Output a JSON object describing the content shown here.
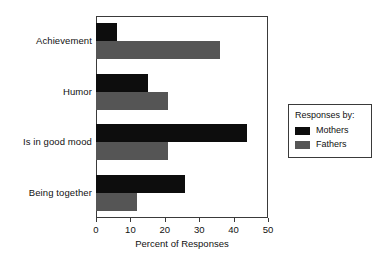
{
  "chart_data": {
    "type": "bar",
    "orientation": "horizontal",
    "title": "",
    "xlabel": "Percent of Responses",
    "ylabel": "",
    "xlim": [
      0,
      50
    ],
    "xticks": [
      0,
      10,
      20,
      30,
      40,
      50
    ],
    "xtick_labels": [
      "0",
      "10",
      "20",
      "30",
      "40",
      "50"
    ],
    "grid": false,
    "categories": [
      "Achievement",
      "Humor",
      "Is in good mood",
      "Being together"
    ],
    "series": [
      {
        "name": "Mothers",
        "color": "#0d0d0d",
        "values": [
          6,
          15,
          44,
          26
        ]
      },
      {
        "name": "Fathers",
        "color": "#555555",
        "values": [
          36,
          21,
          21,
          12
        ]
      }
    ],
    "legend": {
      "position": "right",
      "title": "Responses by:",
      "entries": [
        {
          "label": "Mothers",
          "color": "#0d0d0d"
        },
        {
          "label": "Fathers",
          "color": "#555555"
        }
      ]
    }
  },
  "axis": {
    "x_title": "Percent of Responses",
    "ticks": [
      {
        "value": "0"
      },
      {
        "value": "10"
      },
      {
        "value": "20"
      },
      {
        "value": "30"
      },
      {
        "value": "40"
      },
      {
        "value": "50"
      }
    ]
  },
  "categories": [
    {
      "label": "Achievement"
    },
    {
      "label": "Humor"
    },
    {
      "label": "Is in good mood"
    },
    {
      "label": "Being together"
    }
  ],
  "legend": {
    "title": "Responses by:",
    "items": [
      {
        "label": "Mothers"
      },
      {
        "label": "Fathers"
      }
    ]
  }
}
